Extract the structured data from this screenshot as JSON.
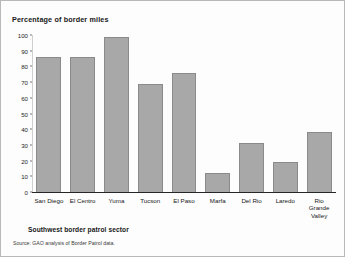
{
  "chart_data": {
    "type": "bar",
    "title": "Percentage of border miles",
    "xlabel": "Southwest border patrol sector",
    "ylabel": "",
    "ylim": [
      0,
      100
    ],
    "ytick_values": [
      0,
      10,
      20,
      30,
      40,
      50,
      60,
      70,
      80,
      90,
      100
    ],
    "ytick_labels": [
      "0",
      "10",
      "20",
      "30",
      "40",
      "50",
      "60",
      "70",
      "80",
      "90",
      "100"
    ],
    "grid": false,
    "legend": "none",
    "bar_color": "#a8a8a8",
    "bar_edge_color": "#8a8a8a",
    "categories": [
      "San Diego",
      "El Centro",
      "Yuma",
      "Tucson",
      "El Paso",
      "Marfa",
      "Del Rio",
      "Laredo",
      "Rio\nGrande\nValley"
    ],
    "values": [
      86,
      86,
      99,
      69,
      76,
      12,
      31,
      19,
      38
    ],
    "source_note": "Source: GAO analysis of Border Patrol data."
  }
}
